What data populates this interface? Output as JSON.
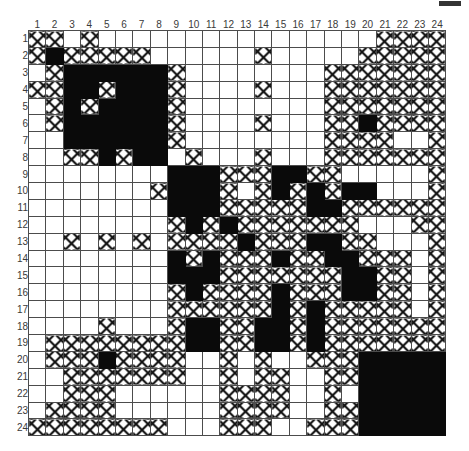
{
  "figure": {
    "title": "",
    "caption": "",
    "corner_mark": "page-corner-mark"
  },
  "axis": {
    "col_labels": [
      "1",
      "2",
      "3",
      "4",
      "5",
      "6",
      "7",
      "8",
      "9",
      "10",
      "11",
      "12",
      "13",
      "14",
      "15",
      "16",
      "17",
      "18",
      "19",
      "20",
      "21",
      "22",
      "23",
      "24"
    ],
    "row_labels": [
      "1",
      "2",
      "3",
      "4",
      "5",
      "6",
      "7",
      "8",
      "9",
      "10",
      "11",
      "12",
      "13",
      "14",
      "15",
      "16",
      "17",
      "18",
      "19",
      "20",
      "21",
      "22",
      "23",
      "24"
    ]
  },
  "legend": {
    "state_0": "empty",
    "state_1": "hatched",
    "state_2": "filled"
  },
  "colors": {
    "fill": "#0a0a0a",
    "hatch": "#111111",
    "empty": "#ffffff",
    "grid": "#4c4c4c",
    "label": "#3a3a3a"
  },
  "chart_data": {
    "type": "heatmap",
    "title": "",
    "xlabel": "",
    "ylabel": "",
    "legend_position": "none",
    "grid": true,
    "value_levels": [
      0,
      1,
      2
    ],
    "value_names": [
      "empty",
      "hatched",
      "filled"
    ],
    "x": [
      "1",
      "2",
      "3",
      "4",
      "5",
      "6",
      "7",
      "8",
      "9",
      "10",
      "11",
      "12",
      "13",
      "14",
      "15",
      "16",
      "17",
      "18",
      "19",
      "20",
      "21",
      "22",
      "23",
      "24"
    ],
    "y": [
      "1",
      "2",
      "3",
      "4",
      "5",
      "6",
      "7",
      "8",
      "9",
      "10",
      "11",
      "12",
      "13",
      "14",
      "15",
      "16",
      "17",
      "18",
      "19",
      "20",
      "21",
      "22",
      "23",
      "24"
    ],
    "values": [
      [
        1,
        1,
        0,
        1,
        0,
        0,
        0,
        0,
        0,
        0,
        0,
        0,
        0,
        0,
        0,
        0,
        0,
        0,
        0,
        0,
        1,
        1,
        1,
        1
      ],
      [
        1,
        2,
        1,
        1,
        1,
        1,
        1,
        0,
        0,
        0,
        0,
        0,
        0,
        1,
        0,
        0,
        0,
        0,
        0,
        1,
        1,
        1,
        1,
        1
      ],
      [
        0,
        1,
        2,
        2,
        2,
        2,
        2,
        2,
        1,
        0,
        0,
        0,
        0,
        0,
        0,
        0,
        0,
        1,
        1,
        1,
        1,
        1,
        1,
        1
      ],
      [
        1,
        1,
        2,
        2,
        1,
        2,
        2,
        2,
        1,
        0,
        0,
        0,
        0,
        1,
        0,
        0,
        0,
        1,
        1,
        1,
        1,
        1,
        1,
        1
      ],
      [
        0,
        1,
        2,
        1,
        2,
        2,
        2,
        2,
        1,
        0,
        0,
        0,
        0,
        0,
        0,
        0,
        0,
        1,
        1,
        1,
        1,
        1,
        1,
        1
      ],
      [
        0,
        1,
        2,
        2,
        2,
        2,
        2,
        2,
        1,
        0,
        0,
        0,
        0,
        1,
        0,
        0,
        0,
        1,
        1,
        2,
        1,
        1,
        1,
        1
      ],
      [
        0,
        0,
        2,
        2,
        2,
        2,
        2,
        2,
        1,
        0,
        0,
        0,
        0,
        0,
        0,
        0,
        0,
        1,
        1,
        1,
        1,
        0,
        0,
        1
      ],
      [
        0,
        0,
        1,
        1,
        2,
        1,
        2,
        2,
        0,
        1,
        0,
        0,
        0,
        1,
        0,
        0,
        0,
        1,
        1,
        1,
        1,
        1,
        1,
        1
      ],
      [
        0,
        0,
        0,
        0,
        0,
        0,
        0,
        0,
        2,
        2,
        2,
        1,
        1,
        1,
        2,
        2,
        1,
        1,
        0,
        0,
        0,
        0,
        0,
        1
      ],
      [
        0,
        0,
        0,
        0,
        0,
        0,
        0,
        1,
        2,
        2,
        2,
        1,
        0,
        1,
        2,
        1,
        2,
        1,
        2,
        2,
        0,
        0,
        0,
        1
      ],
      [
        0,
        0,
        0,
        0,
        0,
        0,
        0,
        0,
        2,
        2,
        2,
        1,
        1,
        1,
        1,
        1,
        2,
        2,
        1,
        1,
        1,
        1,
        1,
        1
      ],
      [
        0,
        0,
        0,
        0,
        0,
        0,
        0,
        0,
        1,
        2,
        1,
        2,
        1,
        1,
        1,
        1,
        1,
        1,
        1,
        0,
        0,
        0,
        1,
        1
      ],
      [
        0,
        0,
        1,
        0,
        1,
        0,
        1,
        0,
        1,
        1,
        1,
        1,
        2,
        1,
        1,
        1,
        2,
        2,
        1,
        1,
        0,
        0,
        0,
        1
      ],
      [
        0,
        0,
        0,
        0,
        0,
        0,
        0,
        0,
        2,
        1,
        2,
        1,
        1,
        1,
        2,
        1,
        1,
        2,
        2,
        1,
        1,
        1,
        0,
        1
      ],
      [
        0,
        0,
        0,
        0,
        0,
        0,
        0,
        0,
        2,
        2,
        2,
        1,
        1,
        1,
        1,
        1,
        1,
        1,
        2,
        2,
        1,
        1,
        0,
        1
      ],
      [
        0,
        0,
        0,
        0,
        0,
        0,
        0,
        0,
        1,
        2,
        1,
        1,
        1,
        1,
        2,
        1,
        1,
        1,
        2,
        2,
        1,
        1,
        0,
        1
      ],
      [
        0,
        0,
        0,
        0,
        0,
        0,
        0,
        0,
        1,
        1,
        1,
        1,
        1,
        1,
        2,
        1,
        2,
        1,
        1,
        1,
        1,
        1,
        0,
        1
      ],
      [
        0,
        0,
        0,
        0,
        1,
        0,
        0,
        0,
        1,
        2,
        2,
        1,
        1,
        2,
        2,
        1,
        2,
        1,
        1,
        1,
        1,
        1,
        1,
        1
      ],
      [
        0,
        1,
        1,
        1,
        1,
        1,
        1,
        1,
        1,
        2,
        2,
        1,
        1,
        2,
        2,
        1,
        2,
        1,
        1,
        1,
        1,
        1,
        1,
        1
      ],
      [
        0,
        1,
        1,
        1,
        2,
        1,
        1,
        1,
        1,
        0,
        0,
        1,
        0,
        1,
        0,
        0,
        1,
        1,
        1,
        2,
        2,
        2,
        2,
        2
      ],
      [
        0,
        0,
        1,
        1,
        1,
        1,
        1,
        1,
        1,
        0,
        0,
        1,
        0,
        1,
        1,
        0,
        0,
        1,
        1,
        2,
        2,
        2,
        2,
        2
      ],
      [
        0,
        0,
        1,
        1,
        1,
        0,
        0,
        0,
        0,
        0,
        0,
        1,
        1,
        1,
        1,
        0,
        0,
        1,
        0,
        2,
        2,
        2,
        2,
        2
      ],
      [
        0,
        1,
        1,
        1,
        1,
        0,
        0,
        0,
        0,
        0,
        0,
        1,
        1,
        1,
        1,
        0,
        0,
        1,
        1,
        2,
        2,
        2,
        2,
        2
      ],
      [
        1,
        1,
        1,
        1,
        1,
        1,
        1,
        1,
        0,
        0,
        0,
        1,
        1,
        1,
        0,
        0,
        1,
        1,
        1,
        2,
        2,
        2,
        2,
        2
      ]
    ]
  }
}
